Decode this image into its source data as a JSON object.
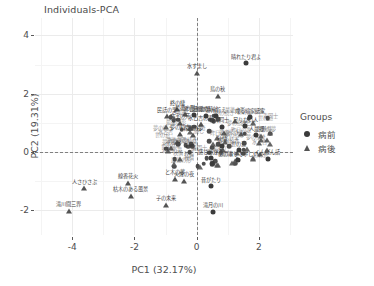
{
  "chart_title": "Individuals-PCA",
  "axes": {
    "x": {
      "label": "PC1 (32.17%)",
      "ticks": [
        "-4",
        "-2",
        "0",
        "2"
      ],
      "tick_values": [
        -4,
        -2,
        0,
        2
      ],
      "range": [
        -5.2,
        3.1
      ]
    },
    "y": {
      "label": "PC2 (19.31%)",
      "ticks": [
        "4",
        "2",
        "0",
        "-2"
      ],
      "tick_values": [
        4,
        2,
        0,
        -2
      ],
      "range": [
        -2.85,
        4.6
      ]
    }
  },
  "legend": {
    "title": "Groups",
    "items": [
      {
        "label": "病前",
        "shape": "circle"
      },
      {
        "label": "病後",
        "shape": "triangle"
      }
    ]
  },
  "reference_lines": {
    "vertical_at_x": 0,
    "horizontal_at_y": 0,
    "style": "dashed"
  },
  "chart_data": {
    "type": "scatter",
    "title": "Individuals-PCA",
    "xlabel": "PC1 (32.17%)",
    "ylabel": "PC2 (19.31%)",
    "xlim": [
      -5.2,
      3.1
    ],
    "ylim": [
      -2.85,
      4.6
    ],
    "grid": true,
    "legend_position": "right",
    "series": [
      {
        "name": "病前",
        "shape": "circle"
      },
      {
        "name": "病後",
        "shape": "triangle"
      }
    ],
    "points": [
      {
        "label": "晴れたり君よ",
        "x": 1.58,
        "y": 3.05,
        "group": "病前"
      },
      {
        "label": "水すまし",
        "x": 0.02,
        "y": 2.72,
        "group": "病後"
      },
      {
        "label": "鳥の秋",
        "x": 0.68,
        "y": 1.93,
        "group": "病後"
      },
      {
        "label": "終の棲",
        "x": -0.62,
        "y": 1.47,
        "group": "病後"
      },
      {
        "label": "最後の形",
        "x": -0.38,
        "y": 1.3,
        "group": "病後"
      },
      {
        "label": "民話の里",
        "x": -0.95,
        "y": 1.22,
        "group": "病後"
      },
      {
        "label": "昨日の歌",
        "x": -0.07,
        "y": 1.26,
        "group": "病前"
      },
      {
        "label": "目覚め時計",
        "x": 0.3,
        "y": 1.24,
        "group": "病前"
      },
      {
        "label": "文字の死",
        "x": -0.55,
        "y": 1.0,
        "group": "病後"
      },
      {
        "label": "水と吉の表",
        "x": 0.14,
        "y": 0.96,
        "group": "病後"
      },
      {
        "label": "夢の続き",
        "x": -0.52,
        "y": 0.62,
        "group": "病後"
      },
      {
        "label": "春野の夢",
        "x": -0.12,
        "y": 0.6,
        "group": "病後"
      },
      {
        "label": "静用首え",
        "x": 0.62,
        "y": 1.22,
        "group": "病前"
      },
      {
        "label": "成る暗家話家",
        "x": 1.72,
        "y": 1.2,
        "group": "病前"
      },
      {
        "label": "足りない人",
        "x": 1.56,
        "y": 0.88,
        "group": "病前"
      },
      {
        "label": "青同士",
        "x": 0.8,
        "y": 0.86,
        "group": "病前"
      },
      {
        "label": "人最郷",
        "x": 1.92,
        "y": 0.58,
        "group": "病前"
      },
      {
        "label": "世の窓",
        "x": 1.35,
        "y": 0.06,
        "group": "病前"
      },
      {
        "label": "秋情",
        "x": 0.82,
        "y": 0.22,
        "group": "病前"
      },
      {
        "label": "感じあかる",
        "x": 0.45,
        "y": -0.22,
        "group": "病前"
      },
      {
        "label": "「あの事りて寧しい」",
        "x": 1.34,
        "y": -0.28,
        "group": "病前"
      },
      {
        "label": "くんぼん話",
        "x": 2.28,
        "y": -0.24,
        "group": "病前"
      },
      {
        "label": "昔がたり",
        "x": 0.46,
        "y": -1.18,
        "group": "病前"
      },
      {
        "label": "滝月の川",
        "x": 0.52,
        "y": -2.06,
        "group": "病前"
      },
      {
        "label": "子の未来",
        "x": -0.98,
        "y": -1.82,
        "group": "病後"
      },
      {
        "label": "線香花火",
        "x": -2.22,
        "y": -1.06,
        "group": "病後"
      },
      {
        "label": "枯木のある風景",
        "x": -2.12,
        "y": -1.5,
        "group": "病後"
      },
      {
        "label": "と木の夢",
        "x": -0.7,
        "y": -0.92,
        "group": "病後"
      },
      {
        "label": "火煙の夜",
        "x": -0.42,
        "y": -0.98,
        "group": "病後"
      },
      {
        "label": "人さひさぶ",
        "x": -3.62,
        "y": -1.24,
        "group": "病後"
      },
      {
        "label": "滝川間三界",
        "x": -4.12,
        "y": -2.02,
        "group": "病後"
      }
    ],
    "cluster_note": "Dense overlapping cluster of additional unlabeled/overprinted individuals near the origin between PC1 -1.2 and 2.4, PC2 -0.6 and 1.4"
  }
}
